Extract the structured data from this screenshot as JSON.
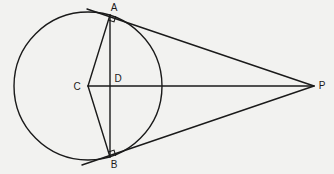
{
  "diagram": {
    "type": "geometry",
    "stroke_color": "#1a1a1a",
    "background_color": "#f2f2f0",
    "circle": {
      "center_label": "C",
      "cx": 88,
      "cy": 86,
      "r": 74
    },
    "points": {
      "A": {
        "label": "A",
        "x": 110,
        "y": 15
      },
      "B": {
        "label": "B",
        "x": 110,
        "y": 157
      },
      "C": {
        "label": "C",
        "x": 88,
        "y": 86
      },
      "D": {
        "label": "D",
        "x": 110,
        "y": 86
      },
      "P": {
        "label": "P",
        "x": 314,
        "y": 86
      }
    },
    "segments": [
      "CA",
      "CB",
      "AB",
      "CP",
      "PA (tangent, extended past A)",
      "PB (tangent, extended past B)"
    ],
    "right_angle_marks": [
      "A",
      "B"
    ]
  }
}
